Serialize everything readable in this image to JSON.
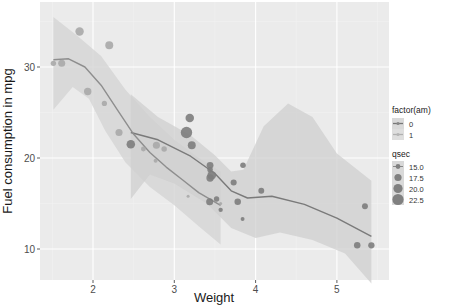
{
  "chart_data": {
    "type": "scatter",
    "title": "",
    "xlabel": "Weight",
    "ylabel": "Fuel consumption in mpg",
    "xlim": [
      1.35,
      5.6
    ],
    "ylim": [
      7,
      37.5
    ],
    "x_ticks": [
      2,
      3,
      4,
      5
    ],
    "y_ticks": [
      10,
      20,
      30
    ],
    "grid": true,
    "legend_position": "right",
    "legends": [
      {
        "title": "factor(am)",
        "entries": [
          "0",
          "1"
        ]
      },
      {
        "title": "qsec",
        "entries": [
          "15.0",
          "17.5",
          "20.0",
          "22.5"
        ]
      }
    ],
    "points": [
      {
        "x": 1.513,
        "y": 30.4,
        "am": 1,
        "qsec": 16.9
      },
      {
        "x": 1.615,
        "y": 30.4,
        "am": 1,
        "qsec": 18.52
      },
      {
        "x": 1.835,
        "y": 33.9,
        "am": 1,
        "qsec": 19.9
      },
      {
        "x": 1.935,
        "y": 27.3,
        "am": 1,
        "qsec": 18.9
      },
      {
        "x": 2.14,
        "y": 26.0,
        "am": 1,
        "qsec": 16.7
      },
      {
        "x": 2.2,
        "y": 32.4,
        "am": 1,
        "qsec": 19.47
      },
      {
        "x": 2.32,
        "y": 22.8,
        "am": 1,
        "qsec": 18.61
      },
      {
        "x": 2.465,
        "y": 21.5,
        "am": 0,
        "qsec": 20.01
      },
      {
        "x": 2.62,
        "y": 21.0,
        "am": 1,
        "qsec": 16.46
      },
      {
        "x": 2.77,
        "y": 19.7,
        "am": 1,
        "qsec": 15.5
      },
      {
        "x": 2.78,
        "y": 21.4,
        "am": 1,
        "qsec": 18.6
      },
      {
        "x": 2.875,
        "y": 21.0,
        "am": 1,
        "qsec": 17.02
      },
      {
        "x": 3.15,
        "y": 22.8,
        "am": 0,
        "qsec": 22.9
      },
      {
        "x": 3.17,
        "y": 15.8,
        "am": 1,
        "qsec": 14.5
      },
      {
        "x": 3.19,
        "y": 24.4,
        "am": 0,
        "qsec": 20.0
      },
      {
        "x": 3.215,
        "y": 21.4,
        "am": 0,
        "qsec": 19.44
      },
      {
        "x": 3.435,
        "y": 15.2,
        "am": 0,
        "qsec": 18.52
      },
      {
        "x": 3.44,
        "y": 18.7,
        "am": 0,
        "qsec": 17.02
      },
      {
        "x": 3.44,
        "y": 19.2,
        "am": 0,
        "qsec": 18.3
      },
      {
        "x": 3.44,
        "y": 17.8,
        "am": 0,
        "qsec": 18.9
      },
      {
        "x": 3.46,
        "y": 18.1,
        "am": 0,
        "qsec": 20.22
      },
      {
        "x": 3.52,
        "y": 15.5,
        "am": 0,
        "qsec": 16.87
      },
      {
        "x": 3.57,
        "y": 14.3,
        "am": 0,
        "qsec": 15.84
      },
      {
        "x": 3.57,
        "y": 15.0,
        "am": 1,
        "qsec": 14.6
      },
      {
        "x": 3.73,
        "y": 17.3,
        "am": 0,
        "qsec": 17.6
      },
      {
        "x": 3.78,
        "y": 15.2,
        "am": 0,
        "qsec": 18.0
      },
      {
        "x": 3.84,
        "y": 13.3,
        "am": 0,
        "qsec": 15.41
      },
      {
        "x": 3.845,
        "y": 19.2,
        "am": 0,
        "qsec": 17.05
      },
      {
        "x": 4.07,
        "y": 16.4,
        "am": 0,
        "qsec": 17.4
      },
      {
        "x": 5.25,
        "y": 10.4,
        "am": 0,
        "qsec": 17.98
      },
      {
        "x": 5.345,
        "y": 14.7,
        "am": 0,
        "qsec": 17.42
      },
      {
        "x": 5.424,
        "y": 10.4,
        "am": 0,
        "qsec": 17.82
      }
    ],
    "series": [
      {
        "name": "am = 0 (loess)",
        "x": [
          2.465,
          2.8,
          3.2,
          3.5,
          3.7,
          3.9,
          4.2,
          4.6,
          5.0,
          5.424
        ],
        "values": [
          22.8,
          22.0,
          20.2,
          18.3,
          16.4,
          15.6,
          15.8,
          14.9,
          13.4,
          11.4
        ]
      },
      {
        "name": "am = 1 (loess)",
        "x": [
          1.513,
          1.7,
          1.9,
          2.1,
          2.3,
          2.5,
          2.7,
          2.9,
          3.1,
          3.3,
          3.57
        ],
        "values": [
          30.8,
          30.9,
          30.0,
          28.0,
          25.3,
          22.6,
          20.6,
          19.0,
          17.6,
          16.2,
          14.8
        ]
      }
    ]
  },
  "page": {
    "xlabel": "Weight",
    "ylabel": "Fuel consumption in mpg",
    "x_tick_labels": [
      "2",
      "3",
      "4",
      "5"
    ],
    "y_tick_labels": [
      "10",
      "20",
      "30"
    ],
    "legend_am_title": "factor(am)",
    "legend_am_labels": [
      "0",
      "1"
    ],
    "legend_qsec_title": "qsec",
    "legend_qsec_labels": [
      "15.0",
      "17.5",
      "20.0",
      "22.5"
    ]
  }
}
